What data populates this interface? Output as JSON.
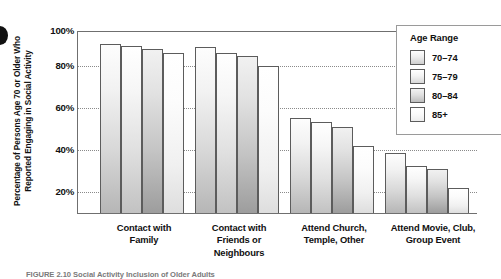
{
  "chart_data": {
    "type": "bar",
    "title": "",
    "xlabel": "",
    "ylabel": "Percentage of Persons Age 70 or Older Who Reported Engaging in Social Activity",
    "ylabel_line1": "Percentage of Persons Age 70 or Older Who",
    "ylabel_line2": "Reported Engaging in Social Activity",
    "ylim": [
      0,
      100
    ],
    "ytick_labels": [
      "20%",
      "40%",
      "60%",
      "80%",
      "100%"
    ],
    "ytick_values": [
      20,
      40,
      60,
      80,
      100
    ],
    "grid": true,
    "grid_axis": "y",
    "legend_position": "top-right",
    "legend_title": "Age Range",
    "categories": [
      "Contact with Family",
      "Contact with Friends or Neighbours",
      "Attend Church, Temple, Other",
      "Attend Movie, Club, Group Event"
    ],
    "category_lines": [
      [
        "Contact with",
        "Family"
      ],
      [
        "Contact with",
        "Friends or",
        "Neighbours"
      ],
      [
        "Attend Church,",
        "Temple, Other"
      ],
      [
        "Attend Movie, Club,",
        "Group Event"
      ]
    ],
    "series": [
      {
        "name": "70–74",
        "values": [
          93,
          91,
          52,
          33
        ]
      },
      {
        "name": "75–79",
        "values": [
          92,
          88,
          50,
          26
        ]
      },
      {
        "name": "80–84",
        "values": [
          90,
          86,
          47,
          24
        ]
      },
      {
        "name": "85+",
        "values": [
          88,
          81,
          37,
          14
        ]
      }
    ]
  },
  "caption": "FIGURE 2.10  Social Activity Inclusion of Older Adults",
  "accent_colors": {
    "axis": "#6f6f6f",
    "gridline": "#8a8a8a",
    "bar_border": "#5c5c5c",
    "text": "#111111"
  }
}
